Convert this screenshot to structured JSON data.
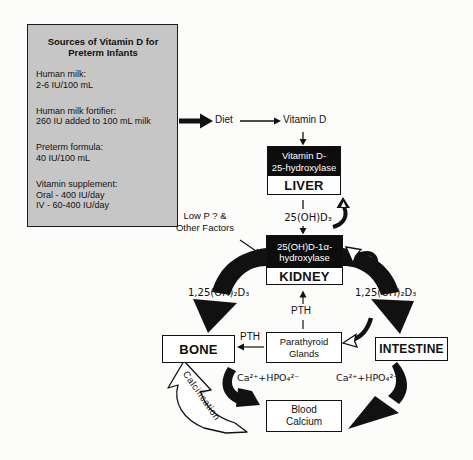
{
  "palette": {
    "panel_gray": "#c6c6c6",
    "box_black": "#0d0d0d",
    "ink": "#111111",
    "background": "#fcfcfa"
  },
  "sources_panel": {
    "title_line1": "Sources of Vitamin D for",
    "title_line2": "Preterm Infants",
    "groups": [
      {
        "lines": [
          "Human milk:",
          "2-6 IU/100 mL"
        ]
      },
      {
        "lines": [
          "Human milk fortifier:",
          "260 IU added to 100 mL milk"
        ]
      },
      {
        "lines": [
          "Preterm formula:",
          "40 IU/100 mL"
        ]
      },
      {
        "lines": [
          "Vitamin supplement:",
          "Oral - 400 IU/day",
          "IV - 60-400 IU/day"
        ]
      }
    ]
  },
  "flow": {
    "diet": "Diet",
    "vitamin_d": "Vitamin D",
    "liver_enzyme_line1": "Vitamin D-",
    "liver_enzyme_line2": "25-hydroxylase",
    "liver": "LIVER",
    "metabolite_25ohd3": "25(OH)D₃",
    "low_p_line1": "Low P ? &",
    "low_p_line2": "Other Factors",
    "kidney_enzyme_line1": "25(OH)D-1α-",
    "kidney_enzyme_line2": "hydroxylase",
    "kidney": "KIDNEY",
    "metabolite_125_left": "1,25(OH)₂D₃",
    "metabolite_125_right": "1,25(OH)₂D₃",
    "pth_vertical": "PTH",
    "pth_horizontal": "PTH",
    "bone": "BONE",
    "parathyroid_line1": "Parathyroid",
    "parathyroid_line2": "Glands",
    "intestine": "INTESTINE",
    "ca_phosphate_left": "Ca²⁺+HPO₄²⁻",
    "ca_phosphate_right": "Ca²⁺+HPO₄²⁻",
    "blood_calcium_line1": "Blood",
    "blood_calcium_line2": "Calcium",
    "calcification": "Calcification"
  }
}
